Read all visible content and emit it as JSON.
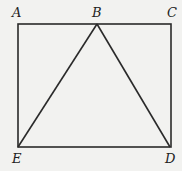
{
  "diagram": {
    "type": "geometry",
    "points": {
      "A": {
        "label": "A",
        "x": 18,
        "y": 24
      },
      "B": {
        "label": "B",
        "x": 97,
        "y": 24
      },
      "C": {
        "label": "C",
        "x": 172,
        "y": 24
      },
      "D": {
        "label": "D",
        "x": 170,
        "y": 147
      },
      "E": {
        "label": "E",
        "x": 18,
        "y": 147
      }
    },
    "segments": [
      [
        "A",
        "C"
      ],
      [
        "C",
        "D"
      ],
      [
        "D",
        "E"
      ],
      [
        "E",
        "A"
      ],
      [
        "E",
        "B"
      ],
      [
        "B",
        "D"
      ]
    ],
    "colors": {
      "line": "#2a2a2a",
      "background": "#f2f2f0"
    }
  }
}
